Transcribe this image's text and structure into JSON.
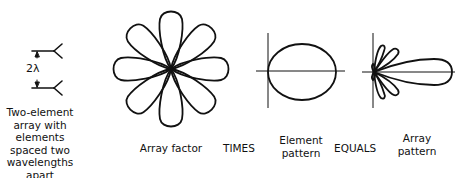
{
  "figure": {
    "panels": [
      {
        "id": "two-element-array",
        "caption": "Two-element\narray with\nelements\nspaced two\nwavelengths\napart",
        "spacing_label": "2λ"
      },
      {
        "id": "array-factor",
        "caption": "Array factor",
        "lobes": 8
      },
      {
        "id": "element-pattern",
        "caption": "Element\npattern"
      },
      {
        "id": "array-pattern",
        "caption": "Array\npattern"
      }
    ],
    "operators": {
      "times": "TIMES",
      "equals": "EQUALS"
    },
    "stroke_color": "#111111",
    "background": "#ffffff"
  }
}
